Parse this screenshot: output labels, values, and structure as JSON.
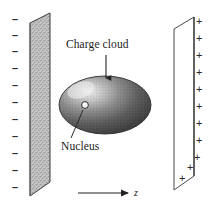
{
  "figure": {
    "background_color": "#ffffff",
    "width": 210,
    "height": 213
  },
  "labels": {
    "charge_cloud": "Charge cloud",
    "nucleus": "Nucleus",
    "axis": "z"
  },
  "plates": {
    "left": {
      "name": "negative-plate",
      "polarity": "negative",
      "sign_glyph": "–",
      "sign_count": 11,
      "fill_color": "#b9b9b9",
      "stroke_color": "#3a3a3a",
      "sign_y_positions": [
        18,
        34,
        50,
        67,
        84,
        101,
        118,
        135,
        152,
        169,
        186
      ],
      "sign_x": 12,
      "shape": "parallelogram",
      "points": "30,23 50,13 50,182 30,196"
    },
    "right": {
      "name": "positive-plate",
      "polarity": "positive",
      "sign_glyph": "+",
      "sign_count": 10,
      "fill_color": "#ffffff",
      "stroke_color": "#4a4a4a",
      "shape": "parallelogram",
      "points": "174,29 194,17 194,176 174,190",
      "sign_positions": [
        {
          "x": 196,
          "y": 21
        },
        {
          "x": 196,
          "y": 38
        },
        {
          "x": 196,
          "y": 55
        },
        {
          "x": 196,
          "y": 72
        },
        {
          "x": 196,
          "y": 89
        },
        {
          "x": 196,
          "y": 106
        },
        {
          "x": 196,
          "y": 123
        },
        {
          "x": 196,
          "y": 140
        },
        {
          "x": 194,
          "y": 157
        },
        {
          "x": 188,
          "y": 166
        },
        {
          "x": 181,
          "y": 176
        }
      ]
    }
  },
  "charge_cloud": {
    "name": "charge-cloud-ellipse",
    "center_x": 105,
    "center_y": 105,
    "radius_x": 46,
    "radius_y": 29,
    "highlight_x": 80,
    "highlight_y": 90,
    "fill_dark": "#4a4a4a",
    "fill_light": "#e8e8e8",
    "stroke_color": "#2e2e2e"
  },
  "nucleus": {
    "name": "nucleus-dot",
    "center_x": 85,
    "center_y": 105,
    "radius": 3.4,
    "fill_color": "#f2f2f2",
    "stroke_color": "#2b2b2b"
  },
  "annotations": {
    "charge_cloud_arrow": {
      "name": "charge-cloud-arrow",
      "x1": 106,
      "y1": 55,
      "x2": 106,
      "y2": 77,
      "direction": "down"
    },
    "nucleus_leader": {
      "name": "nucleus-leader-line",
      "x1": 83,
      "y1": 110,
      "x2": 71,
      "y2": 137
    },
    "z_axis_arrow": {
      "name": "z-axis-arrow",
      "x1": 78,
      "y1": 193,
      "x2": 130,
      "y2": 193,
      "direction": "right"
    }
  }
}
